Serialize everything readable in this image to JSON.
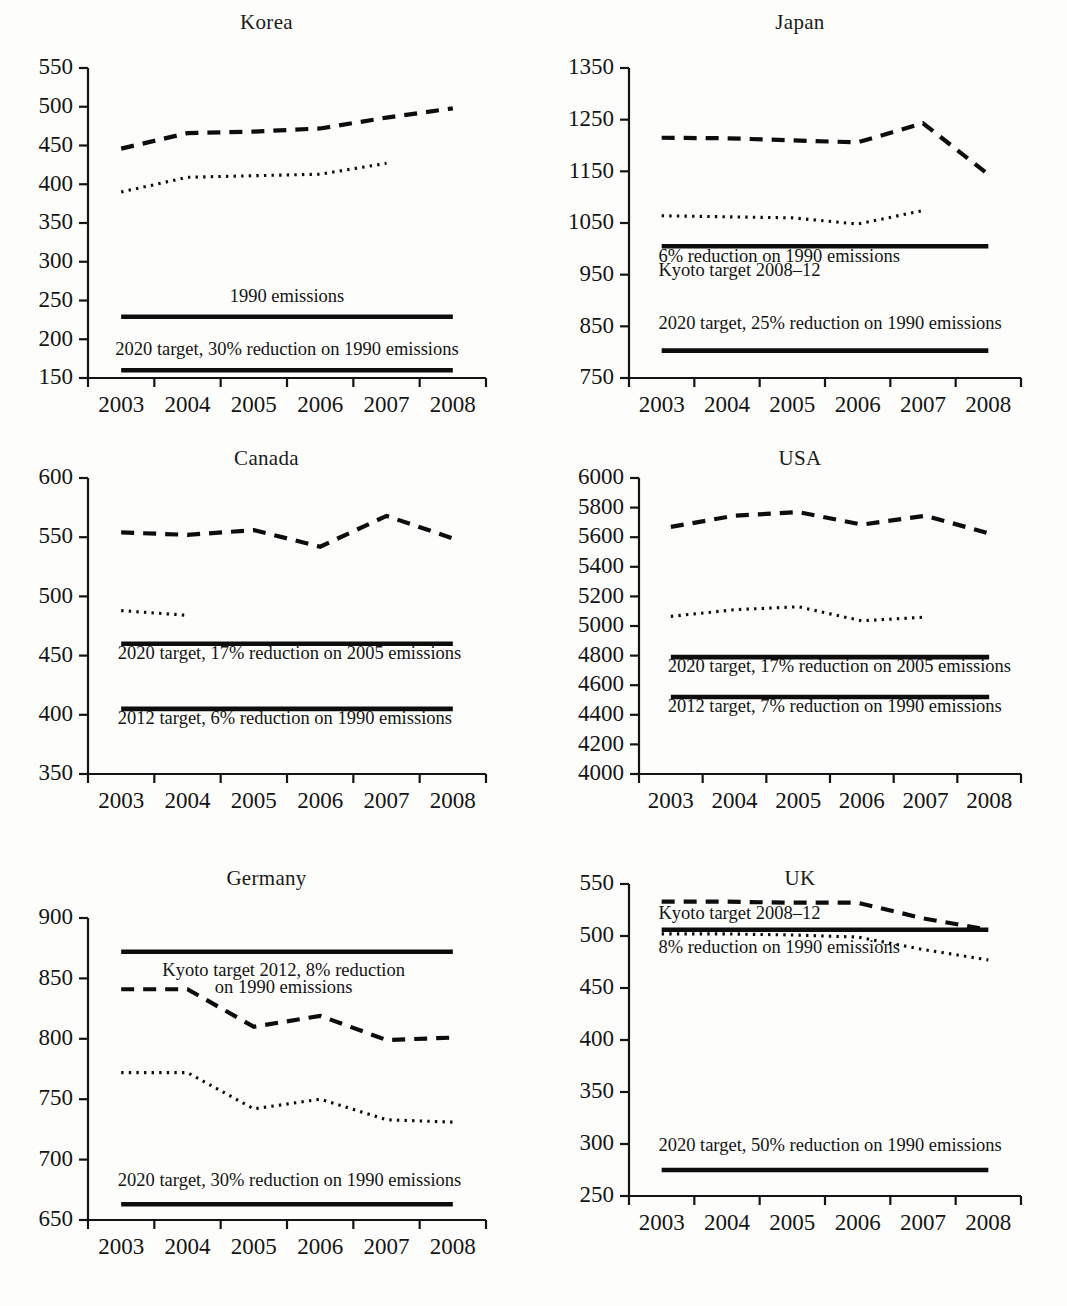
{
  "figure": {
    "layout": "2 columns x 3 rows of small-multiple line charts",
    "x_categories": [
      "2003",
      "2004",
      "2005",
      "2006",
      "2007",
      "2008"
    ],
    "caption": ""
  },
  "chart_data": [
    {
      "type": "line",
      "title": "Korea",
      "xlabel": "",
      "ylabel": "",
      "x": [
        "2003",
        "2004",
        "2005",
        "2006",
        "2007",
        "2008"
      ],
      "xlim": [
        2002.5,
        2008.5
      ],
      "ylim": [
        150,
        550
      ],
      "yticks": [
        150,
        200,
        250,
        300,
        350,
        400,
        450,
        500,
        550
      ],
      "grid": false,
      "legend": "none (inline annotations)",
      "series": [
        {
          "name": "Total emissions (dashed)",
          "style": "dashed",
          "values": [
            446,
            466,
            468,
            472,
            486,
            498
          ]
        },
        {
          "name": "Energy emissions (dotted)",
          "style": "dotted",
          "values": [
            390,
            409,
            411,
            413,
            427,
            null
          ]
        },
        {
          "name": "1990 emissions",
          "style": "solid",
          "values": [
            229,
            229,
            229,
            229,
            229,
            229
          ]
        },
        {
          "name": "2020 target, 30% reduction on 1990 emissions",
          "style": "solid",
          "values": [
            160,
            160,
            160,
            160,
            160,
            160
          ]
        }
      ],
      "annotations": [
        {
          "text": "1990 emissions",
          "x": 2005.5,
          "y": 248,
          "align": "middle"
        },
        {
          "text": "2020 target, 30% reduction on 1990 emissions",
          "x": 2005.5,
          "y": 180,
          "align": "middle"
        }
      ]
    },
    {
      "type": "line",
      "title": "Japan",
      "xlabel": "",
      "ylabel": "",
      "x": [
        "2003",
        "2004",
        "2005",
        "2006",
        "2007",
        "2008"
      ],
      "xlim": [
        2002.5,
        2008.5
      ],
      "ylim": [
        750,
        1350
      ],
      "yticks": [
        750,
        850,
        950,
        1050,
        1150,
        1250,
        1350
      ],
      "grid": false,
      "legend": "none (inline annotations)",
      "series": [
        {
          "name": "Total emissions (dashed)",
          "style": "dashed",
          "values": [
            1215,
            1214,
            1210,
            1206,
            1243,
            1144
          ]
        },
        {
          "name": "Energy emissions (dotted)",
          "style": "dotted",
          "values": [
            1064,
            1062,
            1060,
            1048,
            1074,
            null
          ]
        },
        {
          "name": "6% reduction on 1990 emissions / Kyoto target 2008-12",
          "style": "solid",
          "values": [
            1005,
            1005,
            1005,
            1005,
            1005,
            1005
          ]
        },
        {
          "name": "2020 target, 25% reduction on 1990 emissions",
          "style": "solid",
          "values": [
            803,
            803,
            803,
            803,
            803,
            803
          ]
        }
      ],
      "annotations": [
        {
          "text": "6% reduction on 1990 emissions",
          "x": 2002.95,
          "y": 975,
          "align": "start"
        },
        {
          "text": "Kyoto target 2008–12",
          "x": 2002.95,
          "y": 947,
          "align": "start"
        },
        {
          "text": "2020 target, 25% reduction on 1990 emissions",
          "x": 2002.95,
          "y": 845,
          "align": "start"
        }
      ]
    },
    {
      "type": "line",
      "title": "Canada",
      "xlabel": "",
      "ylabel": "",
      "x": [
        "2003",
        "2004",
        "2005",
        "2006",
        "2007",
        "2008"
      ],
      "xlim": [
        2002.5,
        2008.5
      ],
      "ylim": [
        350,
        600
      ],
      "yticks": [
        350,
        400,
        450,
        500,
        550,
        600
      ],
      "grid": false,
      "legend": "none (inline annotations)",
      "series": [
        {
          "name": "Total emissions (dashed)",
          "style": "dashed",
          "values": [
            554,
            552,
            556,
            542,
            568,
            549
          ]
        },
        {
          "name": "Energy emissions (dotted)",
          "style": "dotted",
          "values": [
            488,
            484,
            null,
            null,
            null,
            null
          ]
        },
        {
          "name": "2020 target, 17% reduction on 2005 emissions",
          "style": "solid",
          "values": [
            460,
            460,
            460,
            460,
            460,
            460
          ]
        },
        {
          "name": "2012 target, 6% reduction on 1990 emissions",
          "style": "solid",
          "values": [
            405,
            405,
            405,
            405,
            405,
            405
          ]
        }
      ],
      "annotations": [
        {
          "text": "2020 target, 17% reduction on 2005 emissions",
          "x": 2002.95,
          "y": 447,
          "align": "start"
        },
        {
          "text": "2012 target, 6% reduction on 1990 emissions",
          "x": 2002.95,
          "y": 392,
          "align": "start"
        }
      ]
    },
    {
      "type": "line",
      "title": "USA",
      "xlabel": "",
      "ylabel": "",
      "x": [
        "2003",
        "2004",
        "2005",
        "2006",
        "2007",
        "2008"
      ],
      "xlim": [
        2002.5,
        2008.5
      ],
      "ylim": [
        4000,
        6000
      ],
      "yticks": [
        4000,
        4200,
        4400,
        4600,
        4800,
        5000,
        5200,
        5400,
        5600,
        5800,
        6000
      ],
      "grid": false,
      "legend": "none (inline annotations)",
      "series": [
        {
          "name": "Total emissions (dashed)",
          "style": "dashed",
          "values": [
            5670,
            5745,
            5770,
            5685,
            5745,
            5625
          ]
        },
        {
          "name": "Energy emissions (dotted)",
          "style": "dotted",
          "values": [
            5065,
            5110,
            5130,
            5035,
            5060,
            null
          ]
        },
        {
          "name": "2020 target, 17% reduction on 2005 emissions",
          "style": "solid",
          "values": [
            4790,
            4790,
            4790,
            4790,
            4790,
            4790
          ]
        },
        {
          "name": "2012 target, 7% reduction on 1990 emissions",
          "style": "solid",
          "values": [
            4520,
            4520,
            4520,
            4520,
            4520,
            4520
          ]
        }
      ],
      "annotations": [
        {
          "text": "2020 target, 17% reduction on 2005 emissions",
          "x": 2002.95,
          "y": 4690,
          "align": "start"
        },
        {
          "text": "2012 target, 7% reduction on 1990 emissions",
          "x": 2002.95,
          "y": 4420,
          "align": "start"
        }
      ]
    },
    {
      "type": "line",
      "title": "Germany",
      "xlabel": "",
      "ylabel": "",
      "x": [
        "2003",
        "2004",
        "2005",
        "2006",
        "2007",
        "2008"
      ],
      "xlim": [
        2002.5,
        2008.5
      ],
      "ylim": [
        650,
        900
      ],
      "yticks": [
        650,
        700,
        750,
        800,
        850,
        900
      ],
      "grid": false,
      "legend": "none (inline annotations)",
      "series": [
        {
          "name": "Total emissions (dashed)",
          "style": "dashed",
          "values": [
            841,
            841,
            810,
            819,
            799,
            801
          ]
        },
        {
          "name": "Energy emissions (dotted)",
          "style": "dotted",
          "values": [
            772,
            772,
            742,
            750,
            733,
            731
          ]
        },
        {
          "name": "Kyoto target 2012, 8% reduction on 1990 emissions",
          "style": "solid",
          "values": [
            872,
            872,
            872,
            872,
            872,
            872
          ]
        },
        {
          "name": "2020 target, 30% reduction on 1990 emissions",
          "style": "solid",
          "values": [
            663,
            663,
            663,
            663,
            663,
            663
          ]
        }
      ],
      "annotations": [
        {
          "text": "Kyoto target 2012, 8% reduction",
          "x": 2005.45,
          "y": 852,
          "align": "middle"
        },
        {
          "text": "on 1990 emissions",
          "x": 2005.45,
          "y": 838,
          "align": "middle"
        },
        {
          "text": "2020 target, 30% reduction on 1990 emissions",
          "x": 2002.95,
          "y": 678,
          "align": "start"
        }
      ]
    },
    {
      "type": "line",
      "title": "UK",
      "xlabel": "",
      "ylabel": "",
      "x": [
        "2003",
        "2004",
        "2005",
        "2006",
        "2007",
        "2008"
      ],
      "xlim": [
        2002.5,
        2008.5
      ],
      "ylim": [
        250,
        550
      ],
      "yticks": [
        250,
        300,
        350,
        400,
        450,
        500,
        550
      ],
      "grid": false,
      "legend": "none (inline annotations)",
      "series": [
        {
          "name": "Total emissions (dashed)",
          "style": "dashed",
          "values": [
            533,
            533,
            532,
            532,
            517,
            506
          ]
        },
        {
          "name": "Energy emissions (dotted)",
          "style": "dotted",
          "values": [
            502,
            502,
            501,
            499,
            487,
            477
          ]
        },
        {
          "name": "Kyoto target 2008-12, 8% reduction on 1990 emissions",
          "style": "solid",
          "values": [
            506,
            506,
            506,
            506,
            506,
            506
          ]
        },
        {
          "name": "2020 target, 50% reduction on 1990 emissions",
          "style": "solid",
          "values": [
            275,
            275,
            275,
            275,
            275,
            275
          ]
        }
      ],
      "annotations": [
        {
          "text": "Kyoto target 2008–12",
          "x": 2002.95,
          "y": 516,
          "align": "start"
        },
        {
          "text": "8% reduction on 1990 emissions",
          "x": 2002.95,
          "y": 484,
          "align": "start"
        },
        {
          "text": "2020 target, 50% reduction on 1990 emissions",
          "x": 2002.95,
          "y": 293,
          "align": "start"
        }
      ]
    }
  ]
}
